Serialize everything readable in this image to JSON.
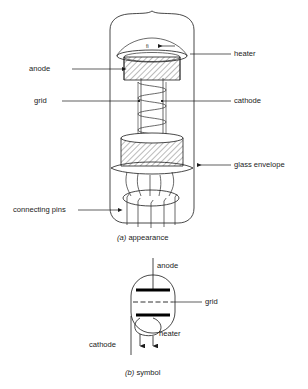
{
  "figure": {
    "title_a": "(a) appearance",
    "title_a_prefix": "(a)",
    "title_a_text": " appearance",
    "title_b_prefix": "(b)",
    "title_b_text": " symbol"
  },
  "appearance": {
    "labels": {
      "anode": "anode",
      "grid": "grid",
      "heater": "heater",
      "cathode": "cathode",
      "glass_envelope": "glass envelope",
      "connecting_pins": "connecting pins"
    }
  },
  "symbol": {
    "labels": {
      "anode": "anode",
      "grid": "grid",
      "heater": "heater",
      "cathode": "cathode"
    }
  },
  "colors": {
    "ink": "#1b1b1b",
    "background": "#ffffff",
    "electrode": "#000000"
  }
}
